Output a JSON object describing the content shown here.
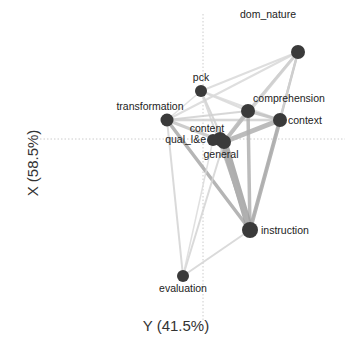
{
  "chart_data": {
    "type": "network",
    "xlabel": "Y (41.5%)",
    "ylabel": "X (58.5%)",
    "axes": {
      "vertical_zero_x": 203,
      "horizontal_zero_y": 139,
      "style": "dotted"
    },
    "node_color": "#3a3a3a",
    "edge_color_light": "#d4d4d4",
    "edge_color_dark": "#a8a8a8",
    "nodes": [
      {
        "id": "dom_nature",
        "label": "dom_nature",
        "x": 298,
        "y": 52,
        "r": 7,
        "lx": 268,
        "ly": 18,
        "anchor": "middle"
      },
      {
        "id": "pck",
        "label": "pck",
        "x": 201,
        "y": 91,
        "r": 6,
        "lx": 201,
        "ly": 81,
        "anchor": "middle"
      },
      {
        "id": "transformation",
        "label": "transformation",
        "x": 167,
        "y": 120,
        "r": 6.5,
        "lx": 150,
        "ly": 110,
        "anchor": "middle"
      },
      {
        "id": "comprehension",
        "label": "comprehension",
        "x": 248,
        "y": 111,
        "r": 7,
        "lx": 289,
        "ly": 102,
        "anchor": "middle"
      },
      {
        "id": "context",
        "label": "context",
        "x": 280,
        "y": 120,
        "r": 7,
        "lx": 288,
        "ly": 124,
        "anchor": "start"
      },
      {
        "id": "content",
        "label": "content",
        "x": 220,
        "y": 139,
        "r": 7,
        "lx": 207,
        "ly": 132,
        "anchor": "middle"
      },
      {
        "id": "qual_le",
        "label": "qual_l&e",
        "x": 213,
        "y": 140,
        "r": 6,
        "lx": 206,
        "ly": 143,
        "anchor": "end"
      },
      {
        "id": "general",
        "label": "general",
        "x": 224,
        "y": 142,
        "r": 7,
        "lx": 221,
        "ly": 158,
        "anchor": "middle"
      },
      {
        "id": "instruction",
        "label": "instruction",
        "x": 250,
        "y": 230,
        "r": 8,
        "lx": 261,
        "ly": 234,
        "anchor": "start"
      },
      {
        "id": "evaluation",
        "label": "evaluation",
        "x": 183,
        "y": 276,
        "r": 6,
        "lx": 183,
        "ly": 292,
        "anchor": "middle"
      }
    ],
    "edges": [
      {
        "from": "dom_nature",
        "to": "pck",
        "w": 2,
        "c": "#d8d8d8"
      },
      {
        "from": "dom_nature",
        "to": "transformation",
        "w": 2,
        "c": "#d8d8d8"
      },
      {
        "from": "dom_nature",
        "to": "comprehension",
        "w": 2.5,
        "c": "#cfcfcf"
      },
      {
        "from": "dom_nature",
        "to": "context",
        "w": 2.5,
        "c": "#bdbdbd"
      },
      {
        "from": "dom_nature",
        "to": "general",
        "w": 3,
        "c": "#cfcfcf"
      },
      {
        "from": "dom_nature",
        "to": "instruction",
        "w": 2,
        "c": "#d0d0d0"
      },
      {
        "from": "pck",
        "to": "comprehension",
        "w": 2,
        "c": "#d8d8d8"
      },
      {
        "from": "pck",
        "to": "general",
        "w": 2,
        "c": "#d0d0d0"
      },
      {
        "from": "pck",
        "to": "instruction",
        "w": 2,
        "c": "#d6d6d6"
      },
      {
        "from": "pck",
        "to": "context",
        "w": 2,
        "c": "#dadada"
      },
      {
        "from": "pck",
        "to": "transformation",
        "w": 1.5,
        "c": "#dcdcdc"
      },
      {
        "from": "transformation",
        "to": "comprehension",
        "w": 2,
        "c": "#d0d0d0"
      },
      {
        "from": "transformation",
        "to": "context",
        "w": 2.5,
        "c": "#d0d0d0"
      },
      {
        "from": "transformation",
        "to": "general",
        "w": 3,
        "c": "#c4c4c4"
      },
      {
        "from": "transformation",
        "to": "instruction",
        "w": 3.5,
        "c": "#a8a8a8"
      },
      {
        "from": "transformation",
        "to": "evaluation",
        "w": 2,
        "c": "#d4d4d4"
      },
      {
        "from": "comprehension",
        "to": "context",
        "w": 3,
        "c": "#c0c0c0"
      },
      {
        "from": "comprehension",
        "to": "general",
        "w": 4,
        "c": "#b8b8b8"
      },
      {
        "from": "comprehension",
        "to": "instruction",
        "w": 3.5,
        "c": "#b0b0b0"
      },
      {
        "from": "context",
        "to": "general",
        "w": 5,
        "c": "#b0b0b0"
      },
      {
        "from": "context",
        "to": "instruction",
        "w": 4,
        "c": "#a8a8a8"
      },
      {
        "from": "general",
        "to": "instruction",
        "w": 7,
        "c": "#a0a0a0"
      },
      {
        "from": "content",
        "to": "instruction",
        "w": 4,
        "c": "#b0b0b0"
      },
      {
        "from": "general",
        "to": "evaluation",
        "w": 2,
        "c": "#d4d4d4"
      },
      {
        "from": "instruction",
        "to": "evaluation",
        "w": 2,
        "c": "#d4d4d4"
      },
      {
        "from": "qual_le",
        "to": "evaluation",
        "w": 1.5,
        "c": "#dadada"
      }
    ]
  }
}
